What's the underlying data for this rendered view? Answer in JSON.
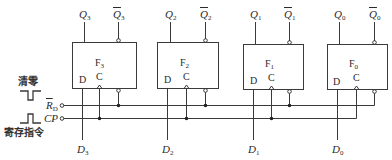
{
  "diagram": {
    "type": "4-bit D flip-flop register",
    "flip_flops": [
      {
        "name": "F",
        "sub": "3",
        "q": "Q",
        "q_sub": "3",
        "qbar": "Q",
        "qbar_sub": "3",
        "d_pin": "D",
        "c_pin": "C",
        "d_input": "D",
        "d_input_sub": "3"
      },
      {
        "name": "F",
        "sub": "2",
        "q": "Q",
        "q_sub": "2",
        "qbar": "Q",
        "qbar_sub": "2",
        "d_pin": "D",
        "c_pin": "C",
        "d_input": "D",
        "d_input_sub": "2"
      },
      {
        "name": "F",
        "sub": "1",
        "q": "Q",
        "q_sub": "1",
        "qbar": "Q",
        "qbar_sub": "1",
        "d_pin": "D",
        "c_pin": "C",
        "d_input": "D",
        "d_input_sub": "1"
      },
      {
        "name": "F",
        "sub": "0",
        "q": "Q",
        "q_sub": "0",
        "qbar": "Q",
        "qbar_sub": "0",
        "d_pin": "D",
        "c_pin": "C",
        "d_input": "D",
        "d_input_sub": "0"
      }
    ],
    "inputs": {
      "reset": {
        "label": "R",
        "sub": "D",
        "overbar": true
      },
      "clock": {
        "label": "CP"
      }
    },
    "legend": {
      "clear_label": "清零",
      "store_label": "寄存指令"
    },
    "colors": {
      "line": "#3a3a3a",
      "background": "#ffffff"
    }
  }
}
